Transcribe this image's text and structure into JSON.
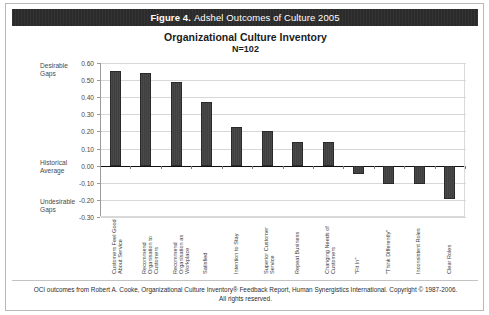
{
  "header": {
    "figure_label": "Figure 4.",
    "figure_title": "Adshel Outcomes of Culture 2005"
  },
  "chart_title": "Organizational Culture Inventory",
  "chart_subtitle": "N=102",
  "zones": {
    "desirable": "Desirable\nGaps",
    "desirable_line1": "Desirable",
    "desirable_line2": "Gaps",
    "historical_line1": "Historical",
    "historical_line2": "Average",
    "undesirable_line1": "Undesirable",
    "undesirable_line2": "Gaps"
  },
  "footer": {
    "line1": "OCI outcomes from Robert A. Cooke, Organizational Culture Inventory® Feedback Report, Human Synergistics International. Copyright © 1987-2006.",
    "line2": "All rights reserved."
  },
  "colors": {
    "bar": "#3f3f3f",
    "header_bg": "#2b2b2b",
    "grid": "#d7d7d7",
    "zero_line": "#111111"
  },
  "chart_data": {
    "type": "bar",
    "title": "Organizational Culture Inventory",
    "subtitle": "N=102",
    "xlabel": "",
    "ylabel": "",
    "ylim": [
      -0.3,
      0.6
    ],
    "ytick_step": 0.1,
    "grid": true,
    "legend": "none",
    "ytick_labels": [
      "0.60",
      "0.50",
      "0.40",
      "0.30",
      "0.20",
      "0.10",
      "0.00",
      "-0.10",
      "-0.20",
      "-0.30"
    ],
    "ytick_values": [
      0.6,
      0.5,
      0.4,
      0.3,
      0.2,
      0.1,
      0.0,
      -0.1,
      -0.2,
      -0.3
    ],
    "categories": [
      "Customers Feel Good About Service",
      "Recommend Organisation to Customers",
      "Recommend Organisation as Workplace",
      "Satisfied",
      "Intention to Stay",
      "Superior Customer Service",
      "Repeat Business",
      "Changing Needs of Customers",
      "\"Fit In\"",
      "\"Think Differently\"",
      "Inconsistent Roles",
      "Clear Roles"
    ],
    "values": [
      0.555,
      0.54,
      0.49,
      0.375,
      0.225,
      0.2,
      0.14,
      0.14,
      -0.05,
      -0.11,
      -0.11,
      -0.195
    ],
    "annotations": [
      "Desirable Gaps",
      "Historical Average",
      "Undesirable Gaps"
    ]
  }
}
